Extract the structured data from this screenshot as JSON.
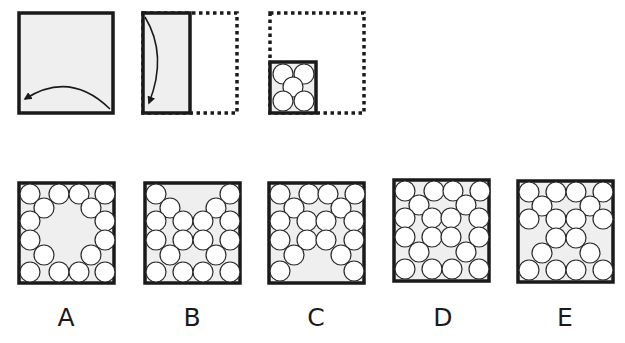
{
  "puzzle": {
    "colors": {
      "border": "#1a1a1a",
      "paper_fill": "#efefef",
      "circle_fill": "#ffffff",
      "circle_stroke": "#2a2a2a"
    },
    "steps": [
      {
        "id": "step-1",
        "description": "Full sheet folded right-to-left",
        "box": {
          "x": 19,
          "y": 13,
          "w": 94,
          "h": 100
        },
        "arrow": "M110,109 Q70,70 25,99"
      },
      {
        "id": "step-2",
        "description": "Half sheet folded top-to-bottom; dotted outline shows original right half",
        "solid_box": {
          "x": 143,
          "y": 13,
          "w": 47,
          "h": 100
        },
        "dotted_box": {
          "x": 143,
          "y": 13,
          "w": 94,
          "h": 100
        },
        "arrow": "M145,17 Q168,55 149,103"
      },
      {
        "id": "step-3",
        "description": "Quarter folded square punched with five holes",
        "dotted_box": {
          "x": 270,
          "y": 13,
          "w": 94,
          "h": 100
        },
        "solid_box": {
          "x": 270,
          "y": 62,
          "w": 46,
          "h": 51
        },
        "holes": [
          [
            13,
            12
          ],
          [
            34,
            12
          ],
          [
            23,
            25
          ],
          [
            13,
            39
          ],
          [
            34,
            39
          ]
        ],
        "hole_radius": 10
      }
    ],
    "options": [
      {
        "label": "A",
        "box": {
          "x": 19,
          "y": 183,
          "w": 95,
          "h": 100
        },
        "label_x": 66,
        "holes": [
          [
            11,
            11
          ],
          [
            40,
            11
          ],
          [
            60,
            11
          ],
          [
            86,
            11
          ],
          [
            25,
            25
          ],
          [
            72,
            25
          ],
          [
            11,
            38
          ],
          [
            86,
            38
          ],
          [
            11,
            57
          ],
          [
            86,
            57
          ],
          [
            25,
            72
          ],
          [
            72,
            72
          ],
          [
            11,
            89
          ],
          [
            40,
            89
          ],
          [
            60,
            89
          ],
          [
            86,
            89
          ]
        ]
      },
      {
        "label": "B",
        "box": {
          "x": 145,
          "y": 183,
          "w": 95,
          "h": 100
        },
        "label_x": 192,
        "holes": [
          [
            11,
            11
          ],
          [
            85,
            11
          ],
          [
            25,
            25
          ],
          [
            71,
            25
          ],
          [
            11,
            38
          ],
          [
            38,
            38
          ],
          [
            58,
            38
          ],
          [
            85,
            38
          ],
          [
            11,
            57
          ],
          [
            38,
            57
          ],
          [
            58,
            57
          ],
          [
            85,
            57
          ],
          [
            25,
            72
          ],
          [
            71,
            72
          ],
          [
            11,
            89
          ],
          [
            38,
            89
          ],
          [
            58,
            89
          ],
          [
            85,
            89
          ]
        ]
      },
      {
        "label": "C",
        "box": {
          "x": 269,
          "y": 183,
          "w": 95,
          "h": 100
        },
        "label_x": 316,
        "holes": [
          [
            11,
            11
          ],
          [
            40,
            11
          ],
          [
            59,
            11
          ],
          [
            86,
            11
          ],
          [
            25,
            25
          ],
          [
            72,
            25
          ],
          [
            11,
            38
          ],
          [
            38,
            38
          ],
          [
            57,
            38
          ],
          [
            85,
            38
          ],
          [
            11,
            57
          ],
          [
            38,
            57
          ],
          [
            57,
            57
          ],
          [
            85,
            57
          ],
          [
            25,
            72
          ],
          [
            72,
            72
          ],
          [
            11,
            88
          ],
          [
            85,
            88
          ]
        ]
      },
      {
        "label": "D",
        "box": {
          "x": 394,
          "y": 180,
          "w": 95,
          "h": 101
        },
        "label_x": 443,
        "holes": [
          [
            11,
            11
          ],
          [
            40,
            11
          ],
          [
            59,
            11
          ],
          [
            86,
            11
          ],
          [
            25,
            25
          ],
          [
            72,
            25
          ],
          [
            11,
            38
          ],
          [
            38,
            38
          ],
          [
            57,
            38
          ],
          [
            85,
            38
          ],
          [
            11,
            57
          ],
          [
            38,
            57
          ],
          [
            57,
            57
          ],
          [
            85,
            57
          ],
          [
            25,
            72
          ],
          [
            72,
            72
          ],
          [
            11,
            89
          ],
          [
            38,
            89
          ],
          [
            58,
            89
          ],
          [
            85,
            89
          ]
        ]
      },
      {
        "label": "E",
        "box": {
          "x": 518,
          "y": 181,
          "w": 95,
          "h": 101
        },
        "label_x": 565,
        "holes": [
          [
            11,
            11
          ],
          [
            38,
            11
          ],
          [
            58,
            11
          ],
          [
            85,
            11
          ],
          [
            24,
            25
          ],
          [
            72,
            25
          ],
          [
            11,
            38
          ],
          [
            38,
            38
          ],
          [
            58,
            38
          ],
          [
            85,
            38
          ],
          [
            38,
            57
          ],
          [
            58,
            57
          ],
          [
            24,
            72
          ],
          [
            72,
            72
          ],
          [
            11,
            89
          ],
          [
            38,
            89
          ],
          [
            58,
            89
          ],
          [
            85,
            89
          ]
        ]
      }
    ],
    "hole_radius": 10,
    "label_y": 305
  }
}
